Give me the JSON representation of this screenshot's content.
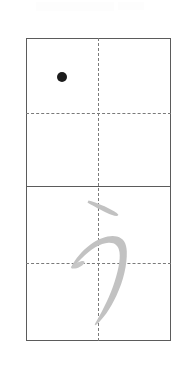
{
  "worksheet": {
    "kind": "kana-handwriting-practice-grid",
    "script": "hiragana",
    "character": "う",
    "character_romaji": "u",
    "background_color": "#ffffff",
    "box": {
      "x": 26,
      "y": 38,
      "width": 145,
      "height": 303,
      "border_color": "#5b5b5b",
      "border_width_px": 1.3,
      "cells": 2
    },
    "guides": {
      "solid_divider_y": 186,
      "dashed_color": "#7a7a7a",
      "horizontal_dashed_y": [
        113,
        263
      ],
      "vertical_dashed_x": 98
    },
    "stroke_start_dot": {
      "label": "stroke-start-dot",
      "x": 62,
      "y": 77,
      "radius": 5,
      "color": "#1c1c1c"
    },
    "model_character": {
      "label": "う",
      "color": "#c2c2c2",
      "cell": "lower",
      "stroke_count": 2,
      "strokes": [
        {
          "index": 1,
          "name": "top-horizontal-tick"
        },
        {
          "index": 2,
          "name": "main-curve-sweep"
        }
      ]
    },
    "faint_header": {
      "visible_text": "",
      "color": "#fdfdfd"
    }
  }
}
